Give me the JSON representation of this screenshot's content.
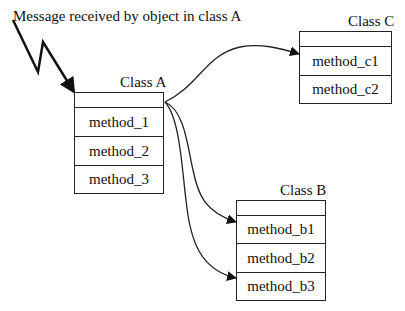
{
  "message_label": "Message received by object in class A",
  "classes": {
    "a": {
      "name": "Class A",
      "methods": [
        "method_1",
        "method_2",
        "method_3"
      ]
    },
    "b": {
      "name": "Class B",
      "methods": [
        "method_b1",
        "method_b2",
        "method_b3"
      ]
    },
    "c": {
      "name": "Class C",
      "methods": [
        "method_c1",
        "method_c2"
      ]
    }
  },
  "connections": [
    {
      "from": "Class A",
      "to": "method_c1"
    },
    {
      "from": "Class A",
      "to": "method_b1"
    },
    {
      "from": "Class A",
      "to": "method_b3"
    }
  ],
  "colors": {
    "line": "#222222",
    "background": "#ffffff"
  }
}
